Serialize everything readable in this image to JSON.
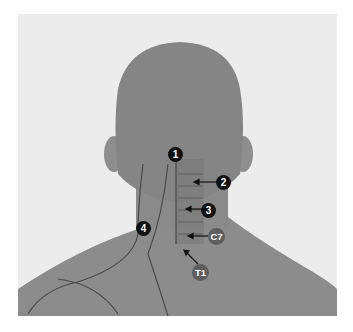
{
  "figure": {
    "colors": {
      "background": "#ececec",
      "skin": "#8a8a8a",
      "marker": "#111111",
      "marker_grey": "#5e5e5e"
    },
    "markers": [
      {
        "id": "1",
        "label": "1"
      },
      {
        "id": "2",
        "label": "2"
      },
      {
        "id": "3",
        "label": "3"
      },
      {
        "id": "4",
        "label": "4"
      },
      {
        "id": "C7",
        "label": "C7"
      },
      {
        "id": "T1",
        "label": "T1"
      }
    ]
  }
}
